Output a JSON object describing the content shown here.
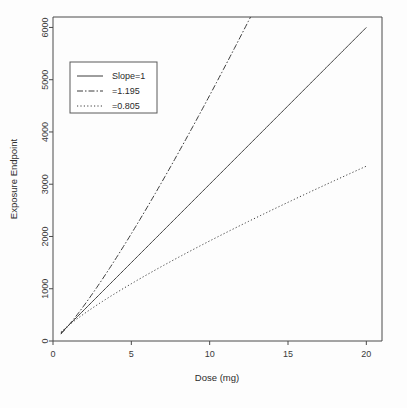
{
  "chart_data": {
    "type": "line",
    "title": "",
    "xlabel": "Dose (mg)",
    "ylabel": "Exposure Endpoint",
    "xlim": [
      0,
      21
    ],
    "ylim": [
      0,
      6200
    ],
    "xticks": [
      "0",
      "5",
      "10",
      "15",
      "20"
    ],
    "xtick_values": [
      0,
      5,
      10,
      15,
      20
    ],
    "yticks": [
      "0",
      "1000",
      "2000",
      "3000",
      "4000",
      "5000",
      "6000"
    ],
    "ytick_values": [
      0,
      1000,
      2000,
      3000,
      4000,
      5000,
      6000
    ],
    "grid": false,
    "legend_position": "top-left",
    "model": "E = 300 * dose^slope",
    "coefficient": 300,
    "x": [
      0.5,
      1,
      2,
      3,
      4,
      5,
      6,
      7,
      8,
      9,
      10,
      11,
      12,
      13,
      14,
      15,
      16,
      17,
      18,
      19,
      20
    ],
    "series": [
      {
        "name": "Slope=1",
        "slope": 1,
        "style": "solid",
        "values": [
          150,
          300,
          600,
          900,
          1200,
          1500,
          1800,
          2100,
          2400,
          2700,
          3000,
          3300,
          3600,
          3900,
          4200,
          4500,
          4800,
          5100,
          5400,
          5700,
          6000
        ]
      },
      {
        "name": "=1.195",
        "slope": 1.195,
        "style": "dashdot",
        "values": [
          131,
          300,
          687,
          1110,
          1573,
          2060,
          2568,
          3094,
          3637,
          4194,
          4765,
          5348,
          5942,
          6548,
          7164,
          7789,
          8424,
          9068,
          9720,
          10381,
          11049
        ]
      },
      {
        "name": "=0.805",
        "slope": 0.805,
        "style": "dotted",
        "values": [
          172,
          300,
          524,
          724,
          913,
          1094,
          1266,
          1433,
          1595,
          1753,
          1908,
          2060,
          2209,
          2355,
          2499,
          2641,
          2781,
          2919,
          3056,
          3190,
          3324
        ]
      }
    ],
    "legend": [
      {
        "label": "Slope=1",
        "style": "solid"
      },
      {
        "label": "=1.195",
        "style": "dashdot"
      },
      {
        "label": "=0.805",
        "style": "dotted"
      }
    ]
  }
}
